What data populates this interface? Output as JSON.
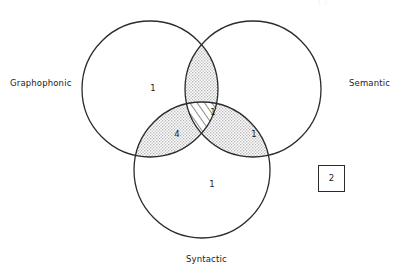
{
  "figure": {
    "type": "venn-diagram-3-set",
    "background_color": "#ffffff",
    "stroke_color": "#2b2b2b",
    "dot_fill_color": "#d8d8d8",
    "hatch_color": "#2b2b2b",
    "caption_ghost": "( )"
  },
  "sets": [
    {
      "id": "graphophonic",
      "label": "Graphophonic",
      "label_x": 10,
      "label_y": 79,
      "cx": 150,
      "cy": 89,
      "r": 68
    },
    {
      "id": "semantic",
      "label": "Semantic",
      "label_x": 349,
      "label_y": 79,
      "cx": 253,
      "cy": 89,
      "r": 68
    },
    {
      "id": "syntactic",
      "label": "Syntactic",
      "label_x": 186,
      "label_y": 255,
      "cx": 202,
      "cy": 170,
      "r": 68
    }
  ],
  "regions": [
    {
      "id": "graphophonic-only",
      "name": "graphophonic-only",
      "count": "1",
      "x": 153,
      "y": 88,
      "fill": "none"
    },
    {
      "id": "semantic-only",
      "name": "semantic-only",
      "count": "",
      "x": 280,
      "y": 88,
      "fill": "none"
    },
    {
      "id": "syntactic-only",
      "name": "syntactic-only",
      "count": "1",
      "x": 212,
      "y": 184,
      "fill": "none"
    },
    {
      "id": "graphophonic-semantic",
      "name": "graphophonic-and-semantic",
      "count": "",
      "x": 202,
      "y": 62,
      "fill": "dots"
    },
    {
      "id": "graphophonic-syntactic",
      "name": "graphophonic-and-syntactic",
      "count": "4",
      "x": 177,
      "y": 134,
      "fill": "dots"
    },
    {
      "id": "semantic-syntactic",
      "name": "semantic-and-syntactic",
      "count": "1",
      "x": 254,
      "y": 134,
      "fill": "dots"
    },
    {
      "id": "all-three",
      "name": "all-three-sets",
      "count": "1",
      "x": 213,
      "y": 112,
      "fill": "hatch"
    }
  ],
  "outside": {
    "name": "outside-universe-count",
    "count": "2",
    "x": 318,
    "y": 165,
    "width": 27,
    "height": 27
  }
}
